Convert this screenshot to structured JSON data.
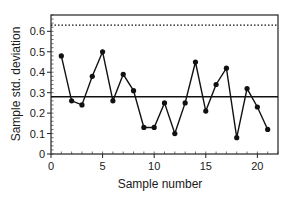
{
  "chart_data": {
    "type": "line",
    "title": "",
    "xlabel": "Sample number",
    "ylabel": "Sample std. deviation",
    "xlim": [
      0,
      22
    ],
    "ylim": [
      0,
      0.68
    ],
    "x_ticks": [
      0,
      5,
      10,
      15,
      20
    ],
    "x_tick_labels": [
      "0",
      "5",
      "10",
      "15",
      "20"
    ],
    "y_ticks": [
      0,
      0.1,
      0.2,
      0.3,
      0.4,
      0.5,
      0.6
    ],
    "y_tick_labels": [
      "0",
      "0.1",
      "0.2",
      "0.3",
      "0.4",
      "0.5",
      "0.6"
    ],
    "grid": false,
    "legend": null,
    "series": [
      {
        "name": "Sample std. deviation",
        "marker": "filled-circle",
        "color": "#111111",
        "x": [
          1,
          2,
          3,
          4,
          5,
          6,
          7,
          8,
          9,
          10,
          11,
          12,
          13,
          14,
          15,
          16,
          17,
          18,
          19,
          20,
          21
        ],
        "values": [
          0.48,
          0.26,
          0.24,
          0.38,
          0.5,
          0.26,
          0.39,
          0.31,
          0.13,
          0.13,
          0.25,
          0.1,
          0.25,
          0.45,
          0.21,
          0.34,
          0.42,
          0.08,
          0.32,
          0.23,
          0.12
        ]
      }
    ],
    "reference_lines": [
      {
        "name": "center-line",
        "y": 0.28,
        "style": "solid"
      },
      {
        "name": "upper-control-limit",
        "y": 0.63,
        "style": "dotted"
      }
    ]
  }
}
